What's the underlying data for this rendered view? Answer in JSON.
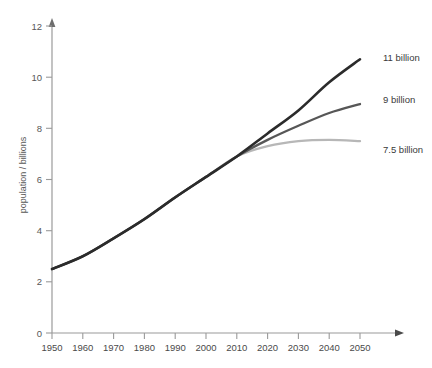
{
  "chart_data": {
    "type": "line",
    "title": "",
    "subtitle": "",
    "xlabel": "",
    "ylabel": "population / billions",
    "xlim": [
      1950,
      2050
    ],
    "ylim": [
      0,
      12
    ],
    "grid": false,
    "legend_position": "right-inline-endpoint-labels",
    "x_ticks": [
      1950,
      1960,
      1970,
      1980,
      1990,
      2000,
      2010,
      2020,
      2030,
      2040,
      2050
    ],
    "y_ticks": [
      0,
      2,
      4,
      6,
      8,
      10,
      12
    ],
    "x": [
      1950,
      1960,
      1970,
      1980,
      1990,
      2000,
      2010,
      2020,
      2030,
      2040,
      2050
    ],
    "series": [
      {
        "name": "high variant",
        "label": "11 billion",
        "color": "#2b2b2b",
        "values": [
          2.5,
          3.0,
          3.7,
          4.45,
          5.3,
          6.1,
          6.9,
          7.8,
          8.7,
          9.8,
          10.7
        ]
      },
      {
        "name": "medium variant",
        "label": "9 billion",
        "color": "#575757",
        "values": [
          2.5,
          3.0,
          3.7,
          4.45,
          5.3,
          6.1,
          6.9,
          7.55,
          8.1,
          8.6,
          8.95
        ]
      },
      {
        "name": "low variant",
        "label": "7.5 billion",
        "color": "#b7b7b7",
        "values": [
          2.5,
          3.0,
          3.7,
          4.45,
          5.3,
          6.1,
          6.9,
          7.3,
          7.5,
          7.55,
          7.5
        ]
      }
    ],
    "annotations": [
      {
        "text": "11 billion",
        "at_x": 2050,
        "at_y": 10.7
      },
      {
        "text": "9 billion",
        "at_x": 2050,
        "at_y": 8.95
      },
      {
        "text": "7.5 billion",
        "at_x": 2050,
        "at_y": 7.5
      }
    ],
    "axis_color": "#9a9a9a",
    "tick_label_color": "#575757"
  },
  "ticks": {
    "y": {
      "t0": "0",
      "t1": "2",
      "t2": "4",
      "t3": "6",
      "t4": "8",
      "t5": "10",
      "t6": "12"
    },
    "x": {
      "t0": "1950",
      "t1": "1960",
      "t2": "1970",
      "t3": "1980",
      "t4": "1990",
      "t5": "2000",
      "t6": "2010",
      "t7": "2020",
      "t8": "2030",
      "t9": "2040",
      "t10": "2050"
    }
  },
  "labels": {
    "y_axis_title": "population / billions",
    "high": "11 billion",
    "medium": "9 billion",
    "low": "7.5 billion"
  }
}
